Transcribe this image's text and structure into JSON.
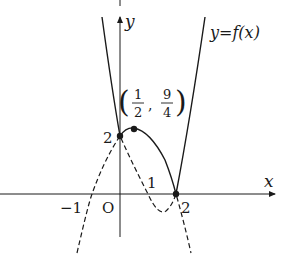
{
  "diagram": {
    "axes": {
      "x_label": "x",
      "y_label": "y",
      "origin_label": "O"
    },
    "curve_label": "y=f(x)",
    "tick_labels": {
      "x_minus_1": "−1",
      "x_1": "1",
      "x_2": "2",
      "y_2": "2"
    },
    "point_label": {
      "open": "(",
      "x_num": "1",
      "x_den": "2",
      "comma": ",",
      "y_num": "9",
      "y_den": "4",
      "close": ")"
    },
    "points": [
      {
        "name": "y-intercept",
        "x": 0,
        "y": 2
      },
      {
        "name": "local-max",
        "x": 0.5,
        "y": 2.25
      },
      {
        "name": "root",
        "x": 2,
        "y": 0
      }
    ],
    "colors": {
      "stroke": "#1a1a1a",
      "background": "#ffffff"
    }
  }
}
